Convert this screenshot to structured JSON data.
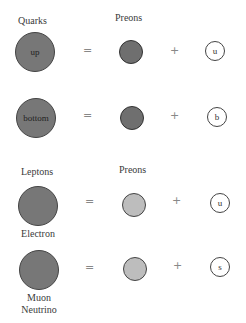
{
  "colors": {
    "background": "#ffffff",
    "composite_particle": "#777777",
    "quark_preon": "#6f6f6f",
    "lepton_preon": "#bdbdbd",
    "flavor_preon": "#ffffff"
  },
  "quarks": {
    "header": "Quarks",
    "preons_header": "Preons",
    "rows": [
      {
        "particle": "up",
        "equals": "=",
        "plus": "+",
        "flavor": "u"
      },
      {
        "particle": "bottom",
        "equals": "=",
        "plus": "+",
        "flavor": "b"
      }
    ]
  },
  "leptons": {
    "header": "Leptons",
    "preons_header": "Preons",
    "rows": [
      {
        "particle": "Electron",
        "equals": "=",
        "plus": "+",
        "flavor": "u"
      },
      {
        "particle_line1": "Muon",
        "particle_line2": "Neutrino",
        "equals": "=",
        "plus": "+",
        "flavor": "s"
      }
    ]
  }
}
